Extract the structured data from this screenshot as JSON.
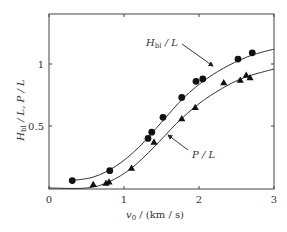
{
  "chart_data": {
    "type": "scatter",
    "title": "",
    "xlabel": "v0 / (km/s)",
    "ylabel": "Hbl / L, P / L",
    "xlim": [
      0,
      3
    ],
    "ylim": [
      0,
      1.35
    ],
    "x_ticks": [
      "0",
      "1",
      "2",
      "3"
    ],
    "y_ticks": [
      "0.5",
      "1"
    ],
    "grid": false,
    "legend": "inline annotations with arrows",
    "series": [
      {
        "name": "Hbl / L",
        "marker": "circle",
        "points": [
          [
            0.31,
            0.06
          ],
          [
            0.81,
            0.14
          ],
          [
            1.32,
            0.4
          ],
          [
            1.37,
            0.45
          ],
          [
            1.52,
            0.57
          ],
          [
            1.77,
            0.73
          ],
          [
            1.96,
            0.86
          ],
          [
            2.05,
            0.88
          ],
          [
            2.52,
            1.04
          ],
          [
            2.71,
            1.09
          ]
        ],
        "fit_curve": [
          [
            0.3,
            0.06
          ],
          [
            0.6,
            0.09
          ],
          [
            0.9,
            0.18
          ],
          [
            1.2,
            0.33
          ],
          [
            1.5,
            0.53
          ],
          [
            1.8,
            0.73
          ],
          [
            2.1,
            0.88
          ],
          [
            2.4,
            0.99
          ],
          [
            2.7,
            1.07
          ],
          [
            3.0,
            1.12
          ]
        ]
      },
      {
        "name": "P / L",
        "marker": "triangle",
        "points": [
          [
            0.59,
            0.03
          ],
          [
            0.76,
            0.04
          ],
          [
            0.8,
            0.05
          ],
          [
            1.1,
            0.16
          ],
          [
            1.4,
            0.37
          ],
          [
            1.77,
            0.56
          ],
          [
            1.95,
            0.65
          ],
          [
            2.33,
            0.85
          ],
          [
            2.55,
            0.87
          ],
          [
            2.63,
            0.91
          ],
          [
            2.68,
            0.89
          ]
        ],
        "fit_curve": [
          [
            0.0,
            0.0
          ],
          [
            0.5,
            0.0
          ],
          [
            0.8,
            0.05
          ],
          [
            1.1,
            0.16
          ],
          [
            1.4,
            0.33
          ],
          [
            1.7,
            0.52
          ],
          [
            2.0,
            0.68
          ],
          [
            2.3,
            0.8
          ],
          [
            2.6,
            0.89
          ],
          [
            3.0,
            0.96
          ]
        ]
      }
    ],
    "annotations": [
      {
        "text": "Hbl / L",
        "at": [
          1.5,
          1.12
        ],
        "arrow_to": [
          2.2,
          0.97
        ]
      },
      {
        "text": "P / L",
        "at": [
          1.9,
          0.25
        ],
        "arrow_to": [
          1.6,
          0.43
        ]
      }
    ]
  },
  "axes": {
    "x_label_main": "v",
    "x_label_sub": "0",
    "x_label_rest": " / (km / s)",
    "y_label": "H",
    "y_label_sub": "bl",
    "y_label_rest": " / L, P / L"
  },
  "labels": {
    "hbl_main": "H",
    "hbl_sub": "bl",
    "hbl_rest": " / L",
    "pl": "P / L"
  }
}
